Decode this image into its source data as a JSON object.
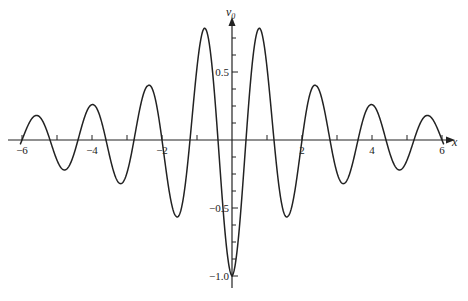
{
  "chart_data": {
    "type": "line",
    "title": "",
    "xlabel": "x",
    "ylabel": "v0",
    "ylabel_main": "v",
    "ylabel_sub": "0",
    "xlim": [
      -6,
      6
    ],
    "ylim": [
      -1.0,
      0.9
    ],
    "grid": false,
    "legend": null,
    "x_ticks": {
      "major": [
        -6,
        -4,
        -2,
        2,
        4,
        6
      ],
      "labels": [
        "-6",
        "-4",
        "-2",
        "2",
        "4",
        "6"
      ],
      "minor_step": 0.5
    },
    "y_ticks": {
      "major": [
        0.5,
        -0.5,
        -1.0
      ],
      "labels": [
        "0.5",
        "-0.5",
        "-1.0"
      ],
      "minor_step": 0.125
    },
    "series": [
      {
        "name": "v0(x)",
        "color": "#222222",
        "extrema": [
          {
            "x": -5.6,
            "y": 0.18
          },
          {
            "x": -4.8,
            "y": -0.22
          },
          {
            "x": -4.0,
            "y": 0.26
          },
          {
            "x": -3.2,
            "y": -0.32
          },
          {
            "x": -2.4,
            "y": 0.4
          },
          {
            "x": -1.6,
            "y": -0.56
          },
          {
            "x": -0.8,
            "y": 0.82
          },
          {
            "x": 0.0,
            "y": -1.0
          },
          {
            "x": 0.8,
            "y": 0.82
          },
          {
            "x": 1.6,
            "y": -0.56
          },
          {
            "x": 2.4,
            "y": 0.4
          },
          {
            "x": 3.2,
            "y": -0.32
          },
          {
            "x": 4.0,
            "y": 0.26
          },
          {
            "x": 4.8,
            "y": -0.22
          },
          {
            "x": 5.6,
            "y": 0.18
          }
        ]
      }
    ]
  }
}
